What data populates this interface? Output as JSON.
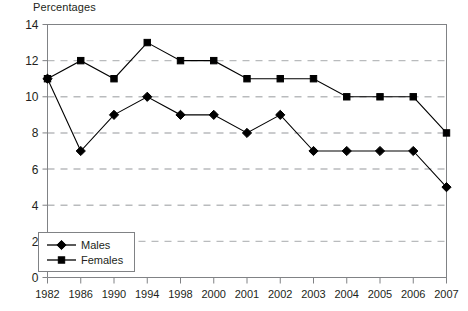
{
  "chart_data": {
    "type": "line",
    "title": "Percentages",
    "xlabel": "",
    "ylabel": "",
    "categories": [
      "1982",
      "1986",
      "1990",
      "1994",
      "1998",
      "2000",
      "2001",
      "2002",
      "2003",
      "2004",
      "2005",
      "2006",
      "2007"
    ],
    "series": [
      {
        "name": "Males",
        "marker": "diamond",
        "color": "#000000",
        "values": [
          11,
          7,
          9,
          10,
          9,
          9,
          8,
          9,
          7,
          7,
          7,
          7,
          5
        ]
      },
      {
        "name": "Females",
        "marker": "square",
        "color": "#000000",
        "values": [
          11,
          12,
          11,
          13,
          12,
          12,
          11,
          11,
          11,
          10,
          10,
          10,
          8
        ]
      }
    ],
    "ylim": [
      0,
      14
    ],
    "ytick_step": 2,
    "ytick_labels": [
      "0",
      "2",
      "4",
      "6",
      "8",
      "10",
      "12",
      "14"
    ],
    "grid": "horizontal-dashed",
    "grid_color": "#b9bbbd",
    "axis_color": "#808285",
    "legend_position": "bottom-left",
    "legend_entries": [
      "Males",
      "Females"
    ]
  }
}
